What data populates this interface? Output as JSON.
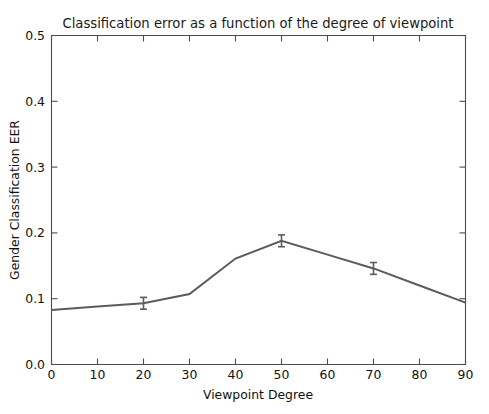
{
  "page": {
    "bleed_text": "· · · · · · · · · · · ·"
  },
  "chart_data": {
    "type": "line",
    "title": "Classification error as a function of the degree of viewpoint",
    "xlabel": "Viewpoint Degree",
    "ylabel": "Gender Classification EER",
    "x": [
      0,
      10,
      20,
      30,
      40,
      50,
      60,
      70,
      80,
      90
    ],
    "values": [
      0.083,
      0.088,
      0.093,
      0.107,
      0.161,
      0.188,
      0.167,
      0.146,
      0.12,
      0.094
    ],
    "xlim": [
      0,
      90
    ],
    "ylim": [
      0.0,
      0.5
    ],
    "xticks": [
      0,
      10,
      20,
      30,
      40,
      50,
      60,
      70,
      80,
      90
    ],
    "xtick_labels": [
      "0",
      "10",
      "20",
      "30",
      "40",
      "50",
      "60",
      "70",
      "80",
      "90"
    ],
    "yticks": [
      0.0,
      0.1,
      0.2,
      0.3,
      0.4,
      0.5
    ],
    "ytick_labels": [
      "0.0",
      "0.1",
      "0.2",
      "0.3",
      "0.4",
      "0.5"
    ],
    "grid": false,
    "legend": false,
    "line_color": "#5b5b5b",
    "axis_color": "#4d4d4d",
    "background": "#ffffff",
    "error_bar_markers_at_x": [
      20,
      50,
      70
    ],
    "error_bar_half_height": 0.009,
    "series": [
      {
        "name": "Gender Classification EER",
        "values": [
          0.083,
          0.088,
          0.093,
          0.107,
          0.161,
          0.188,
          0.167,
          0.146,
          0.12,
          0.094
        ]
      }
    ]
  }
}
